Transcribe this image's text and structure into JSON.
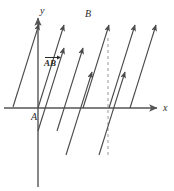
{
  "figure": {
    "type": "vector-diagram",
    "width": 174,
    "height": 191,
    "background_color": "#ffffff",
    "stroke_color": "#4a4a4a",
    "axis_color": "#555555",
    "dashed_color": "#999999",
    "text_color": "#2b2b2b"
  },
  "axes": {
    "origin": {
      "x": 38,
      "y": 108
    },
    "x_axis": {
      "label": "x",
      "label_pos": {
        "x": 163,
        "y": 103
      },
      "from": {
        "x": 4,
        "y": 108
      },
      "to": {
        "x": 157,
        "y": 108
      },
      "arrow": true
    },
    "y_axis": {
      "label": "y",
      "label_pos": {
        "x": 40,
        "y": 6
      },
      "from": {
        "x": 38,
        "y": 187
      },
      "to": {
        "x": 38,
        "y": 18
      },
      "arrow": true
    }
  },
  "points": [
    {
      "name": "A",
      "label": "A",
      "label_pos": {
        "x": 31,
        "y": 112
      }
    },
    {
      "name": "B",
      "label": "B",
      "label_pos": {
        "x": 85,
        "y": 9
      }
    }
  ],
  "vector_label": {
    "text": "AB",
    "notation": "over-right-arrow",
    "pos": {
      "x": 44,
      "y": 55
    }
  },
  "dashed_line": {
    "name": "vertical-dashed-guide",
    "x": 108,
    "y_top": 38,
    "y_bottom": 156,
    "dash": "3 3"
  },
  "vectors": [
    {
      "id": "v1",
      "x1": 13,
      "y1": 107,
      "x2": 39,
      "y2": 24,
      "note": "AB from A-region up to near y-axis top"
    },
    {
      "id": "v2",
      "x1": 38,
      "y1": 108,
      "x2": 64,
      "y2": 25,
      "note": "vector AB from origin A to B"
    },
    {
      "id": "v3",
      "x1": 57,
      "y1": 131,
      "x2": 83,
      "y2": 48
    },
    {
      "id": "v4",
      "x1": 66,
      "y1": 155,
      "x2": 92,
      "y2": 72
    },
    {
      "id": "v5",
      "x1": 38,
      "y1": 131,
      "x2": 64,
      "y2": 48,
      "note": "short translate below axis"
    },
    {
      "id": "v6",
      "x1": 83,
      "y1": 108,
      "x2": 109,
      "y2": 25
    },
    {
      "id": "v7",
      "x1": 109,
      "y1": 108,
      "x2": 135,
      "y2": 25
    },
    {
      "id": "v8",
      "x1": 130,
      "y1": 108,
      "x2": 156,
      "y2": 25
    },
    {
      "id": "v9",
      "x1": 99,
      "y1": 155,
      "x2": 125,
      "y2": 72
    }
  ]
}
